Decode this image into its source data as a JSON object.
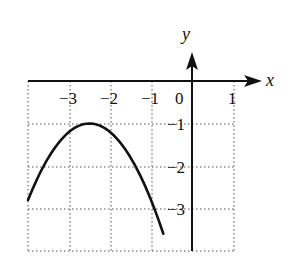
{
  "chart_data": {
    "type": "line",
    "title": "",
    "xlabel": "x",
    "ylabel": "y",
    "xlim": [
      -4,
      1
    ],
    "ylim": [
      -4,
      0
    ],
    "grid": true,
    "grid_style": "dotted",
    "x_ticks": [
      -3,
      -2,
      -1,
      0,
      1
    ],
    "x_tick_labels": [
      "−3",
      "−2",
      "−1",
      "0",
      "1"
    ],
    "y_ticks": [
      -1,
      -2,
      -3
    ],
    "y_tick_labels": [
      "−1",
      "−2",
      "−3"
    ],
    "series": [
      {
        "name": "parabola",
        "description": "downward-opening parabola with vertex at (-2.5, -1)",
        "vertex": [
          -2.5,
          -1
        ],
        "x": [
          -4,
          -3.5,
          -3,
          -2.5,
          -2,
          -1.5,
          -1,
          -0.7
        ],
        "y": [
          -2.8,
          -1.8,
          -1.2,
          -1,
          -1.2,
          -1.8,
          -2.8,
          -3.6
        ]
      }
    ]
  },
  "axes": {
    "x_name": "x",
    "y_name": "y",
    "origin_label": "0"
  },
  "colors": {
    "ink": "#111111",
    "grid": "#555555",
    "background": "#ffffff"
  }
}
